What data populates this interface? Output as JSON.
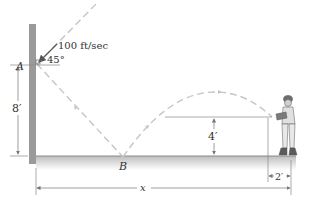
{
  "diagram": {
    "type": "projectile-bounce",
    "labels": {
      "point_a": "A",
      "point_b": "B",
      "speed": "100 ft/sec",
      "angle": "45°",
      "height_a": "8′",
      "bounce_height": "4′",
      "catch_offset": "2′",
      "distance": "x"
    },
    "colors": {
      "wall": "#9a9a9a",
      "path": "#c8c8c8",
      "ground": "#cfcfcf",
      "dimension": "#666666"
    }
  }
}
